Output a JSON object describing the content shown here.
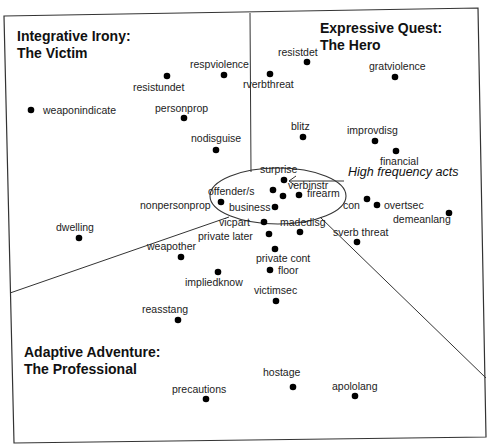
{
  "regions": [
    {
      "id": "integrative",
      "title_line1": "Integrative Irony:",
      "title_line2": "The Victim"
    },
    {
      "id": "expressive",
      "title_line1": "Expressive Quest:",
      "title_line2": "The Hero"
    },
    {
      "id": "adaptive",
      "title_line1": "Adaptive Adventure:",
      "title_line2": "The Professional"
    }
  ],
  "annotation": {
    "label": "High frequency acts"
  },
  "points": [
    {
      "label": "weaponindicate",
      "x": 31,
      "y": 110
    },
    {
      "label": "resistundet",
      "x": 167,
      "y": 76
    },
    {
      "label": "respviolence",
      "x": 224,
      "y": 75
    },
    {
      "label": "personprop",
      "x": 184,
      "y": 118
    },
    {
      "label": "nodisguise",
      "x": 216,
      "y": 150
    },
    {
      "label": "rverbthreat",
      "x": 270,
      "y": 74
    },
    {
      "label": "resistdet",
      "x": 307,
      "y": 62
    },
    {
      "label": "gratviolence",
      "x": 395,
      "y": 77
    },
    {
      "label": "blitz",
      "x": 303,
      "y": 137
    },
    {
      "label": "improvdisg",
      "x": 375,
      "y": 141
    },
    {
      "label": "financial",
      "x": 396,
      "y": 151
    },
    {
      "label": "surprise",
      "x": 284,
      "y": 180
    },
    {
      "label": "offender/s",
      "x": 273,
      "y": 190
    },
    {
      "label": "verbinstr",
      "x": 283,
      "y": 196
    },
    {
      "label": "firearm",
      "x": 299,
      "y": 195
    },
    {
      "label": "business",
      "x": 275,
      "y": 207
    },
    {
      "label": "nonpersonprop",
      "x": 221,
      "y": 202
    },
    {
      "label": "con",
      "x": 367,
      "y": 199
    },
    {
      "label": "overtsec",
      "x": 377,
      "y": 205
    },
    {
      "label": "demeanlang",
      "x": 449,
      "y": 213
    },
    {
      "label": "dwelling",
      "x": 79,
      "y": 238
    },
    {
      "label": "vicpart",
      "x": 264,
      "y": 222
    },
    {
      "label": "madedisg",
      "x": 300,
      "y": 232
    },
    {
      "label": "private later",
      "x": 269,
      "y": 234
    },
    {
      "label": "sverb threat",
      "x": 357,
      "y": 242
    },
    {
      "label": "weapother",
      "x": 181,
      "y": 257
    },
    {
      "label": "private cont",
      "x": 275,
      "y": 249
    },
    {
      "label": "impliedknow",
      "x": 218,
      "y": 272
    },
    {
      "label": "floor",
      "x": 270,
      "y": 270
    },
    {
      "label": "victimsec",
      "x": 276,
      "y": 301
    },
    {
      "label": "reasstang",
      "x": 178,
      "y": 320
    },
    {
      "label": "hostage",
      "x": 293,
      "y": 387
    },
    {
      "label": "precautions",
      "x": 206,
      "y": 399
    },
    {
      "label": "apololang",
      "x": 355,
      "y": 396
    }
  ]
}
